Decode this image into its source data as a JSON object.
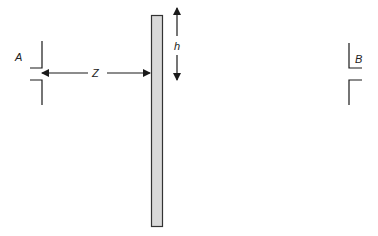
{
  "diagram": {
    "labels": {
      "aperture_a": "A",
      "aperture_b": "B",
      "distance": "Z",
      "height": "h"
    },
    "colors": {
      "line": "#1a1a1a",
      "bar_fill": "#d9d9d9",
      "bar_stroke": "#333333",
      "background": "#ffffff"
    }
  }
}
